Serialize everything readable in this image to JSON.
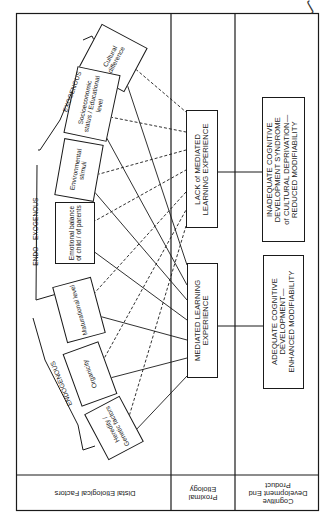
{
  "figure": {
    "corner_mark": "ʃ",
    "rows": {
      "distal": "Distal Etiological Factors",
      "proximal": "Proximal Etiology",
      "end_product": "Cognitive Development End Product"
    },
    "distal_groups": {
      "exogenous": "EXOGENOUS",
      "endo_exogenous": "ENDO—EXOGENOUS",
      "endogenous": "ENDOGENOUS"
    },
    "distal_factors": [
      {
        "id": "cultural",
        "label": "Cultural difference"
      },
      {
        "id": "ses",
        "label": "Socioeconomic status / Educational level"
      },
      {
        "id": "environment",
        "label": "Environmental stimuli"
      },
      {
        "id": "emotional",
        "label": "Emotional balance of child / of parents"
      },
      {
        "id": "maturational",
        "label": "Maturational level"
      },
      {
        "id": "organicity",
        "label": "Organicity"
      },
      {
        "id": "heredity",
        "label": "Heredity / Genetic factors"
      }
    ],
    "proximal_boxes": [
      {
        "id": "lack_mle",
        "line1": "LACK of MEDIATED",
        "line2": "LEARNING EXPERIENCE"
      },
      {
        "id": "mle",
        "line1": "MEDIATED LEARNING",
        "line2": "EXPERIENCE"
      }
    ],
    "outcome_boxes": [
      {
        "id": "inadequate",
        "lines": [
          "INADEQUATE COGNITIVE",
          "DEVELOPMENT SYNDROME",
          "of CULTURAL DEPRIVATION—",
          "REDUCED MODIFIABILITY"
        ]
      },
      {
        "id": "adequate",
        "lines": [
          "ADEQUATE COGNITIVE",
          "DEVELOPMENT—",
          "ENHANCED MODIFIABILITY"
        ]
      }
    ],
    "legend_line_styles": {
      "solid": "connects factor to MEDIATED LEARNING EXPERIENCE",
      "dashed": "connects factor to LACK of MEDIATED LEARNING EXPERIENCE"
    },
    "colors": {
      "ink": "#1a1a1a",
      "paper": "#ffffff"
    }
  }
}
